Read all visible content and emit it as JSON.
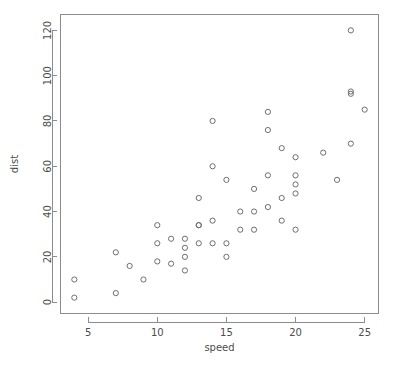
{
  "chart_data": {
    "type": "scatter",
    "title": "",
    "subtitle": "",
    "xlabel": "speed",
    "ylabel": "dist",
    "xlim": [
      3.0,
      26.0
    ],
    "ylim": [
      -5.0,
      127.0
    ],
    "xticks": [
      5,
      10,
      15,
      20,
      25
    ],
    "xticklabels": [
      "5",
      "10",
      "15",
      "20",
      "25"
    ],
    "yticks": [
      0,
      20,
      40,
      60,
      80,
      100,
      120
    ],
    "yticklabels": [
      "0",
      "20",
      "40",
      "60",
      "80",
      "100",
      "120"
    ],
    "grid": false,
    "legend": false,
    "legend_position": "none",
    "marker": "open-circle",
    "marker_color": "#6e6e73",
    "point_count": 50,
    "x": [
      4,
      4,
      7,
      7,
      8,
      9,
      10,
      10,
      10,
      11,
      11,
      12,
      12,
      12,
      12,
      13,
      13,
      13,
      13,
      14,
      14,
      14,
      14,
      15,
      15,
      15,
      16,
      16,
      17,
      17,
      17,
      18,
      18,
      18,
      18,
      19,
      19,
      19,
      20,
      20,
      20,
      20,
      20,
      22,
      23,
      24,
      24,
      24,
      24,
      25
    ],
    "y": [
      2,
      10,
      4,
      22,
      16,
      10,
      18,
      26,
      34,
      17,
      28,
      14,
      20,
      24,
      28,
      26,
      34,
      34,
      46,
      26,
      36,
      60,
      80,
      20,
      26,
      54,
      32,
      40,
      32,
      40,
      50,
      42,
      56,
      76,
      84,
      36,
      46,
      68,
      32,
      48,
      52,
      56,
      64,
      66,
      54,
      70,
      92,
      93,
      120,
      85
    ],
    "series": [
      {
        "name": "cars",
        "points": [
          {
            "x": 4,
            "y": 2
          },
          {
            "x": 4,
            "y": 10
          },
          {
            "x": 7,
            "y": 4
          },
          {
            "x": 7,
            "y": 22
          },
          {
            "x": 8,
            "y": 16
          },
          {
            "x": 9,
            "y": 10
          },
          {
            "x": 10,
            "y": 18
          },
          {
            "x": 10,
            "y": 26
          },
          {
            "x": 10,
            "y": 34
          },
          {
            "x": 11,
            "y": 17
          },
          {
            "x": 11,
            "y": 28
          },
          {
            "x": 12,
            "y": 14
          },
          {
            "x": 12,
            "y": 20
          },
          {
            "x": 12,
            "y": 24
          },
          {
            "x": 12,
            "y": 28
          },
          {
            "x": 13,
            "y": 26
          },
          {
            "x": 13,
            "y": 34
          },
          {
            "x": 13,
            "y": 34
          },
          {
            "x": 13,
            "y": 46
          },
          {
            "x": 14,
            "y": 26
          },
          {
            "x": 14,
            "y": 36
          },
          {
            "x": 14,
            "y": 60
          },
          {
            "x": 14,
            "y": 80
          },
          {
            "x": 15,
            "y": 20
          },
          {
            "x": 15,
            "y": 26
          },
          {
            "x": 15,
            "y": 54
          },
          {
            "x": 16,
            "y": 32
          },
          {
            "x": 16,
            "y": 40
          },
          {
            "x": 17,
            "y": 32
          },
          {
            "x": 17,
            "y": 40
          },
          {
            "x": 17,
            "y": 50
          },
          {
            "x": 18,
            "y": 42
          },
          {
            "x": 18,
            "y": 56
          },
          {
            "x": 18,
            "y": 76
          },
          {
            "x": 18,
            "y": 84
          },
          {
            "x": 19,
            "y": 36
          },
          {
            "x": 19,
            "y": 46
          },
          {
            "x": 19,
            "y": 68
          },
          {
            "x": 20,
            "y": 32
          },
          {
            "x": 20,
            "y": 48
          },
          {
            "x": 20,
            "y": 52
          },
          {
            "x": 20,
            "y": 56
          },
          {
            "x": 20,
            "y": 64
          },
          {
            "x": 22,
            "y": 66
          },
          {
            "x": 23,
            "y": 54
          },
          {
            "x": 24,
            "y": 70
          },
          {
            "x": 24,
            "y": 92
          },
          {
            "x": 24,
            "y": 93
          },
          {
            "x": 24,
            "y": 120
          },
          {
            "x": 25,
            "y": 85
          }
        ]
      }
    ]
  },
  "colors": {
    "background": "#ffffff",
    "axis": "#8c8c8c",
    "text": "#4d4d4d",
    "marker": "#6e6e73"
  }
}
